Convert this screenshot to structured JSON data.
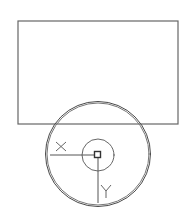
{
  "diagram": {
    "type": "cad-drawing",
    "background": "#ffffff",
    "colors": {
      "line": "#555555",
      "line_dark": "#3a3a3a",
      "line_light": "#8a8a8a"
    },
    "rectangle": {
      "x": 18,
      "y": 21,
      "width": 160,
      "height": 103
    },
    "outer_circle": {
      "cx": 98,
      "cy": 154,
      "r": 52
    },
    "inner_circle": {
      "cx": 98,
      "cy": 155,
      "r": 16
    },
    "origin_marker": {
      "x": 94.5,
      "y": 151.5,
      "size": 6
    },
    "axes": {
      "x": {
        "label": "X",
        "x1": 50,
        "y1": 155,
        "x2": 95,
        "y2": 155
      },
      "y": {
        "label": "Y",
        "x1": 98,
        "y1": 158,
        "x2": 98,
        "y2": 203
      }
    }
  }
}
